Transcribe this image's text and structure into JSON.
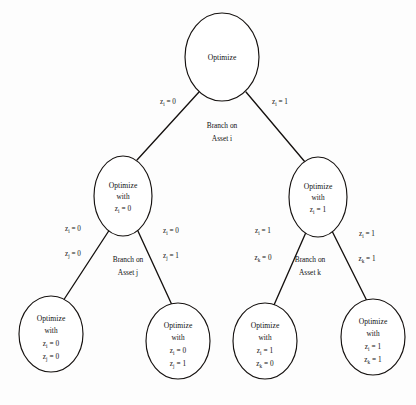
{
  "diagram": {
    "type": "tree",
    "background_color": "#fdfdfd",
    "line_color": "#15110f",
    "text_color": "#121212",
    "nodes": [
      {
        "id": "root",
        "label_title": "Optimize",
        "lines": [
          "Optimize"
        ],
        "cx": 222,
        "cy": 57,
        "rx": 37,
        "ry": 44
      },
      {
        "id": "n-left",
        "label_title": "Optimize",
        "lines": [
          "Optimize",
          "with",
          "z",
          "i",
          " = 0"
        ],
        "line1": "Optimize",
        "line2": "with",
        "line3_var": "z",
        "line3_sub": "i",
        "line3_val": " = 0",
        "cx": 123,
        "cy": 196,
        "rx": 29,
        "ry": 40
      },
      {
        "id": "n-right",
        "label_title": "Optimize",
        "line1": "Optimize",
        "line2": "with",
        "line3_var": "z",
        "line3_sub": "i",
        "line3_val": " = 1",
        "cx": 318,
        "cy": 197,
        "rx": 29,
        "ry": 40
      },
      {
        "id": "leaf-1",
        "line1": "Optimize",
        "line2": "with",
        "line3_var": "z",
        "line3_sub": "i",
        "line3_val": " = 0",
        "line4_var": "z",
        "line4_sub": "j",
        "line4_val": " = 0",
        "cx": 51,
        "cy": 334,
        "rx": 32,
        "ry": 38
      },
      {
        "id": "leaf-2",
        "line1": "Optimize",
        "line2": "with",
        "line3_var": "z",
        "line3_sub": "i",
        "line3_val": " = 0",
        "line4_var": "z",
        "line4_sub": "j",
        "line4_val": " = 1",
        "cx": 178,
        "cy": 341,
        "rx": 32,
        "ry": 38
      },
      {
        "id": "leaf-3",
        "line1": "Optimize",
        "line2": "with",
        "line3_var": "z",
        "line3_sub": "i",
        "line3_val": " = 1",
        "line4_var": "z",
        "line4_sub": "k",
        "line4_val": " = 0",
        "cx": 265,
        "cy": 341,
        "rx": 32,
        "ry": 38
      },
      {
        "id": "leaf-4",
        "line1": "Optimize",
        "line2": "with",
        "line3_var": "z",
        "line3_sub": "i",
        "line3_val": " = 1",
        "line4_var": "z",
        "line4_sub": "k",
        "line4_val": " = 1",
        "cx": 373,
        "cy": 337,
        "rx": 32,
        "ry": 38
      }
    ],
    "branch_labels": [
      {
        "id": "branch-i",
        "line1": "Branch on",
        "line2": "Asset i",
        "x": 222,
        "y": 128
      },
      {
        "id": "branch-j",
        "line1": "Branch on",
        "line2": "Asset j",
        "x": 128,
        "y": 262
      },
      {
        "id": "branch-k",
        "line1": "Branch on",
        "line2": "Asset k",
        "x": 310,
        "y": 262
      }
    ],
    "edge_labels": {
      "root_left": {
        "var": "z",
        "sub": "i",
        "val": " = 0",
        "x": 168,
        "y": 104
      },
      "root_right": {
        "var": "z",
        "sub": "i",
        "val": " = 1",
        "x": 280,
        "y": 104
      },
      "left_left_top": {
        "var": "z",
        "sub": "i",
        "val": " = 0",
        "x": 73,
        "y": 231
      },
      "left_left_bot": {
        "var": "z",
        "sub": "j",
        "val": " = 0",
        "x": 73,
        "y": 256
      },
      "left_right_top": {
        "var": "z",
        "sub": "i",
        "val": " = 0",
        "x": 171,
        "y": 233
      },
      "left_right_bot": {
        "var": "z",
        "sub": "j",
        "val": " = 1",
        "x": 171,
        "y": 258
      },
      "right_left_top": {
        "var": "z",
        "sub": "i",
        "val": " = 1",
        "x": 263,
        "y": 233
      },
      "right_left_bot": {
        "var": "z",
        "sub": "k",
        "val": " = 0",
        "x": 263,
        "y": 260
      },
      "right_right_top": {
        "var": "z",
        "sub": "i",
        "val": " = 1",
        "x": 367,
        "y": 236
      },
      "right_right_bot": {
        "var": "z",
        "sub": "k",
        "val": " = 1",
        "x": 367,
        "y": 261
      }
    },
    "edges": [
      {
        "id": "edge-root-left",
        "x1": 199,
        "y1": 92,
        "x2": 137,
        "y2": 160
      },
      {
        "id": "edge-root-right",
        "x1": 246,
        "y1": 92,
        "x2": 305,
        "y2": 162
      },
      {
        "id": "edge-left-left",
        "x1": 110,
        "y1": 229,
        "x2": 63,
        "y2": 301
      },
      {
        "id": "edge-left-right",
        "x1": 137,
        "y1": 229,
        "x2": 172,
        "y2": 305
      },
      {
        "id": "edge-right-left",
        "x1": 307,
        "y1": 230,
        "x2": 274,
        "y2": 305
      },
      {
        "id": "edge-right-right",
        "x1": 331,
        "y1": 229,
        "x2": 367,
        "y2": 301
      }
    ]
  }
}
